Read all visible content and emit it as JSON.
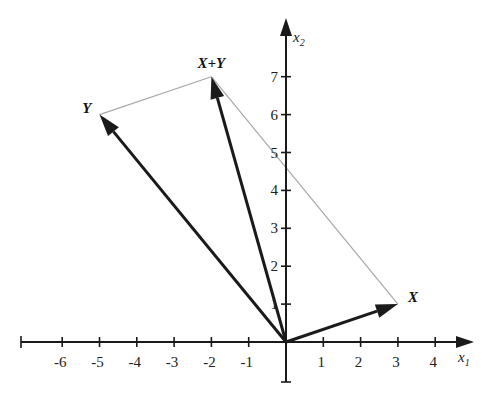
{
  "diagram": {
    "title": "",
    "type": "vector-addition",
    "axes": {
      "x_label": "x",
      "x_subscript": "1",
      "y_label": "x",
      "y_subscript": "2",
      "x_ticks": [
        "-6",
        "-5",
        "-4",
        "-3",
        "-2",
        "-1",
        "1",
        "2",
        "3",
        "4"
      ],
      "y_ticks": [
        "1",
        "2",
        "3",
        "4",
        "5",
        "6",
        "7"
      ],
      "x_range": [
        -7,
        4.6
      ],
      "y_range": [
        -1.1,
        8.4
      ]
    },
    "vectors": [
      {
        "name": "X",
        "label": "X",
        "from": [
          0,
          0
        ],
        "to": [
          3,
          1
        ]
      },
      {
        "name": "Y",
        "label": "Y",
        "from": [
          0,
          0
        ],
        "to": [
          -5,
          6
        ]
      },
      {
        "name": "X+Y",
        "label": "X+Y",
        "from": [
          0,
          0
        ],
        "to": [
          -2,
          7
        ]
      }
    ],
    "parallelogram_edges": [
      {
        "from": [
          -5,
          6
        ],
        "to": [
          -2,
          7
        ]
      },
      {
        "from": [
          3,
          1
        ],
        "to": [
          -2,
          7
        ]
      }
    ],
    "colors": {
      "axis": "#1a1a1a",
      "vector": "#1a1a1a",
      "guide": "#a8a8a8"
    }
  }
}
